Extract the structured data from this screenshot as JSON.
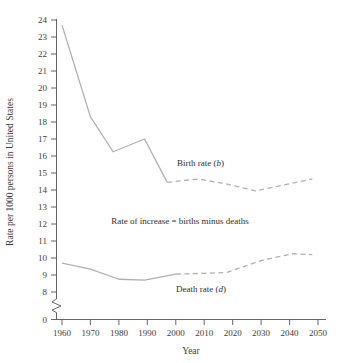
{
  "chart_data": {
    "type": "line",
    "title": "",
    "xlabel": "Year",
    "ylabel": "Rate per 1000 persons in United States",
    "xlim": [
      1960,
      2050
    ],
    "ylim": [
      8,
      24
    ],
    "y_axis_break": true,
    "y_break_from": 0,
    "y_break_to": 8,
    "grid": false,
    "legend_position": "inline-annotations",
    "xticks": [
      1960,
      1970,
      1980,
      1990,
      2000,
      2010,
      2020,
      2030,
      2040,
      2050
    ],
    "xtick_labels": [
      "1960",
      "1970",
      "1980",
      "1990",
      "2000",
      "2010",
      "2020",
      "2030",
      "2040",
      "2050"
    ],
    "yticks": [
      0,
      8,
      9,
      10,
      11,
      12,
      13,
      14,
      15,
      16,
      17,
      18,
      19,
      20,
      21,
      22,
      23,
      24
    ],
    "ytick_labels": [
      "0",
      "8",
      "9",
      "10",
      "11",
      "12",
      "13",
      "14",
      "15",
      "16",
      "17",
      "18",
      "19",
      "20",
      "21",
      "22",
      "23",
      "24"
    ],
    "series": [
      {
        "name": "Birth rate (b)",
        "style": "solid",
        "segment": "historical",
        "color": "#b0b0b0",
        "points": [
          [
            1960,
            23.7
          ],
          [
            1970,
            18.3
          ],
          [
            1978,
            16.25
          ],
          [
            1989,
            17.0
          ],
          [
            1997,
            14.45
          ]
        ]
      },
      {
        "name": "Birth rate (b) projected",
        "style": "dashed",
        "segment": "projected",
        "color": "#b0b0b0",
        "points": [
          [
            1997,
            14.45
          ],
          [
            2008,
            14.65
          ],
          [
            2018,
            14.35
          ],
          [
            2028,
            13.95
          ],
          [
            2048,
            14.65
          ]
        ]
      },
      {
        "name": "Death rate (d)",
        "style": "solid",
        "segment": "historical",
        "color": "#b0b0b0",
        "points": [
          [
            1960,
            9.7
          ],
          [
            1970,
            9.35
          ],
          [
            1980,
            8.75
          ],
          [
            1989,
            8.7
          ],
          [
            2000,
            9.05
          ]
        ]
      },
      {
        "name": "Death rate (d) projected",
        "style": "dashed",
        "segment": "projected",
        "color": "#b0b0b0",
        "points": [
          [
            2000,
            9.05
          ],
          [
            2010,
            9.1
          ],
          [
            2018,
            9.15
          ],
          [
            2030,
            9.85
          ],
          [
            2041,
            10.25
          ],
          [
            2048,
            10.2
          ]
        ]
      }
    ],
    "annotations": [
      {
        "id": "birth-rate-label",
        "text": "Birth rate (b)",
        "italic_tail": "b",
        "x": 2004,
        "y": 15.35
      },
      {
        "id": "rate-of-increase-label",
        "text": "Rate of increase = births minus deaths",
        "x": 2007,
        "y": 12.0
      },
      {
        "id": "death-rate-label",
        "text": "Death rate (d)",
        "italic_tail": "d",
        "x": 2014,
        "y": 8.45
      }
    ]
  },
  "labels": {
    "y_axis_title": "Rate per 1000 persons in United States",
    "x_axis_title": "Year",
    "birth_rate_prefix": "Birth rate (",
    "birth_rate_symbol": "b",
    "birth_rate_suffix": ")",
    "death_rate_prefix": "Death rate (",
    "death_rate_symbol": "d",
    "death_rate_suffix": ")",
    "rate_of_increase": "Rate of increase = births minus deaths"
  },
  "colors": {
    "series_line": "#b0b0b0",
    "axis": "#555555",
    "text": "#3d3d3d",
    "background": "#ffffff"
  }
}
